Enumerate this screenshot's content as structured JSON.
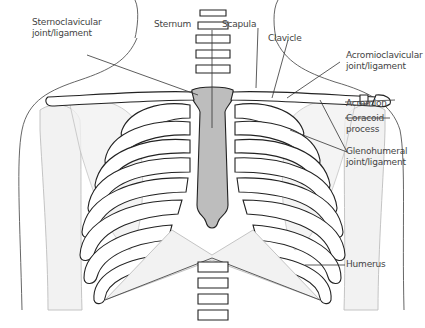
{
  "figure": {
    "colors": {
      "sternum": "#bdbdbd",
      "outline": "#222222",
      "faint_bone": "#f2f2f2",
      "label_text": "#444444"
    },
    "labels": {
      "sternoclavicular_1": "Sternoclavicular",
      "sternoclavicular_2": "joint/ligament",
      "sternum": "Sternum",
      "scapula": "Scapula",
      "clavicle": "Clavicle",
      "acromioclavicular_1": "Acromioclavicular",
      "acromioclavicular_2": "joint/ligament",
      "acromion": "Acromion",
      "coracoid_1": "Coracoid",
      "coracoid_2": "process",
      "glenohumeral_1": "Glenohumeral",
      "glenohumeral_2": "joint/ligament",
      "humerus": "Humerus"
    }
  }
}
